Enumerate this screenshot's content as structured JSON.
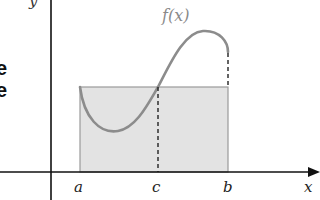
{
  "diagram": {
    "function_label": "f(x)",
    "axes": {
      "x_label": "x",
      "y_label": "y"
    },
    "ticks": [
      {
        "name": "a",
        "label": "a"
      },
      {
        "name": "c",
        "label": "c"
      },
      {
        "name": "b",
        "label": "b"
      }
    ],
    "truncated_left_text": [
      "e",
      "e"
    ],
    "colors": {
      "axis": "#111111",
      "curve": "#8c8c8c",
      "rectangle_fill": "#e3e3e3",
      "rectangle_stroke": "#9a9a9a",
      "dashed": "#222222"
    }
  }
}
